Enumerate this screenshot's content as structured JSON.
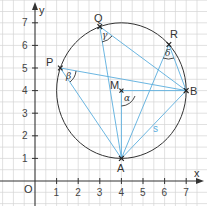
{
  "diagram": {
    "type": "geometry-inscribed-angles",
    "colors": {
      "grid": "#d4d4d4",
      "axis": "#333333",
      "circle": "#333333",
      "lines": "#5aaede",
      "point": "#222222"
    },
    "axes": {
      "x_label": "x",
      "y_label": "y",
      "origin_label": "O",
      "x_ticks": [
        "1",
        "2",
        "3",
        "4",
        "5",
        "6",
        "7"
      ],
      "y_ticks": [
        "1",
        "2",
        "3",
        "4",
        "5",
        "6",
        "7"
      ]
    },
    "circle": {
      "center": "M",
      "center_coords": [
        4,
        4
      ],
      "radius": 3
    },
    "points": [
      {
        "label": "A",
        "coords": [
          4,
          1
        ]
      },
      {
        "label": "B",
        "coords": [
          7,
          4
        ]
      },
      {
        "label": "M",
        "coords": [
          4,
          4
        ]
      },
      {
        "label": "P",
        "coords": [
          1.17,
          5
        ]
      },
      {
        "label": "Q",
        "coords": [
          3,
          6.83
        ]
      },
      {
        "label": "R",
        "coords": [
          6.2,
          6.04
        ]
      }
    ],
    "segments": [
      [
        "P",
        "A"
      ],
      [
        "P",
        "B"
      ],
      [
        "Q",
        "A"
      ],
      [
        "Q",
        "B"
      ],
      [
        "R",
        "A"
      ],
      [
        "R",
        "B"
      ],
      [
        "M",
        "A"
      ],
      [
        "M",
        "B"
      ],
      [
        "A",
        "B"
      ]
    ],
    "segment_label": "s",
    "angles": [
      {
        "label": "α",
        "vertex": "M"
      },
      {
        "label": "β",
        "vertex": "P"
      },
      {
        "label": "γ",
        "vertex": "Q"
      },
      {
        "label": "δ",
        "vertex": "R"
      }
    ]
  }
}
